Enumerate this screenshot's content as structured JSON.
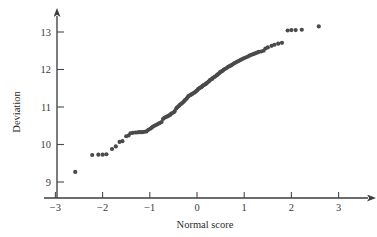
{
  "figure": {
    "kind": "normal-probability-plot",
    "background_color": "#ffffff",
    "point_color": "#4a4a4a",
    "axis_color": "#3d3d3d"
  },
  "chart_data": {
    "type": "scatter",
    "title": "",
    "xlabel": "Normal score",
    "ylabel": "Deviation",
    "xlim": [
      -3.35,
      3.35
    ],
    "ylim": [
      8.6,
      13.45
    ],
    "xticks": [
      -3,
      -2,
      -1,
      0,
      1,
      2,
      3
    ],
    "xtick_labels": [
      "−3",
      "−2",
      "−1",
      "0",
      "1",
      "2",
      "3"
    ],
    "yticks": [
      9,
      10,
      11,
      12,
      13
    ],
    "ytick_labels": [
      "9",
      "10",
      "11",
      "12",
      "13"
    ],
    "grid": false,
    "legend": null,
    "axis_style": "arrow-tipped",
    "marker": "filled-circle",
    "marker_size_px": 2.5,
    "n_points": 117,
    "points": [
      [
        -2.58,
        9.27
      ],
      [
        -2.22,
        9.72
      ],
      [
        -2.09,
        9.73
      ],
      [
        -2.0,
        9.73
      ],
      [
        -1.92,
        9.74
      ],
      [
        -1.8,
        9.88
      ],
      [
        -1.72,
        9.95
      ],
      [
        -1.64,
        10.07
      ],
      [
        -1.58,
        10.09
      ],
      [
        -1.5,
        10.22
      ],
      [
        -1.45,
        10.24
      ],
      [
        -1.41,
        10.3
      ],
      [
        -1.36,
        10.31
      ],
      [
        -1.31,
        10.32
      ],
      [
        -1.27,
        10.32
      ],
      [
        -1.23,
        10.33
      ],
      [
        -1.19,
        10.33
      ],
      [
        -1.15,
        10.33
      ],
      [
        -1.11,
        10.34
      ],
      [
        -1.07,
        10.35
      ],
      [
        -1.03,
        10.39
      ],
      [
        -0.99,
        10.42
      ],
      [
        -0.96,
        10.45
      ],
      [
        -0.93,
        10.48
      ],
      [
        -0.9,
        10.5
      ],
      [
        -0.87,
        10.52
      ],
      [
        -0.84,
        10.54
      ],
      [
        -0.81,
        10.56
      ],
      [
        -0.78,
        10.58
      ],
      [
        -0.75,
        10.6
      ],
      [
        -0.72,
        10.68
      ],
      [
        -0.69,
        10.71
      ],
      [
        -0.66,
        10.73
      ],
      [
        -0.63,
        10.75
      ],
      [
        -0.6,
        10.77
      ],
      [
        -0.57,
        10.79
      ],
      [
        -0.55,
        10.82
      ],
      [
        -0.52,
        10.84
      ],
      [
        -0.49,
        10.86
      ],
      [
        -0.47,
        10.89
      ],
      [
        -0.44,
        10.96
      ],
      [
        -0.42,
        10.99
      ],
      [
        -0.39,
        11.02
      ],
      [
        -0.37,
        11.05
      ],
      [
        -0.34,
        11.08
      ],
      [
        -0.32,
        11.1
      ],
      [
        -0.29,
        11.13
      ],
      [
        -0.27,
        11.16
      ],
      [
        -0.25,
        11.19
      ],
      [
        -0.22,
        11.22
      ],
      [
        -0.2,
        11.26
      ],
      [
        -0.18,
        11.29
      ],
      [
        -0.15,
        11.31
      ],
      [
        -0.13,
        11.33
      ],
      [
        -0.11,
        11.34
      ],
      [
        -0.09,
        11.36
      ],
      [
        -0.06,
        11.38
      ],
      [
        -0.04,
        11.4
      ],
      [
        -0.02,
        11.42
      ],
      [
        0.0,
        11.44
      ],
      [
        0.02,
        11.47
      ],
      [
        0.04,
        11.49
      ],
      [
        0.06,
        11.51
      ],
      [
        0.09,
        11.53
      ],
      [
        0.11,
        11.55
      ],
      [
        0.13,
        11.57
      ],
      [
        0.15,
        11.59
      ],
      [
        0.18,
        11.61
      ],
      [
        0.2,
        11.63
      ],
      [
        0.22,
        11.65
      ],
      [
        0.25,
        11.68
      ],
      [
        0.27,
        11.71
      ],
      [
        0.29,
        11.73
      ],
      [
        0.32,
        11.75
      ],
      [
        0.34,
        11.78
      ],
      [
        0.37,
        11.8
      ],
      [
        0.39,
        11.82
      ],
      [
        0.42,
        11.85
      ],
      [
        0.44,
        11.87
      ],
      [
        0.47,
        11.9
      ],
      [
        0.49,
        11.93
      ],
      [
        0.52,
        11.95
      ],
      [
        0.55,
        11.97
      ],
      [
        0.57,
        12.0
      ],
      [
        0.6,
        12.02
      ],
      [
        0.63,
        12.04
      ],
      [
        0.66,
        12.07
      ],
      [
        0.69,
        12.09
      ],
      [
        0.72,
        12.11
      ],
      [
        0.75,
        12.13
      ],
      [
        0.78,
        12.16
      ],
      [
        0.81,
        12.18
      ],
      [
        0.84,
        12.2
      ],
      [
        0.87,
        12.22
      ],
      [
        0.9,
        12.24
      ],
      [
        0.93,
        12.26
      ],
      [
        0.96,
        12.28
      ],
      [
        0.99,
        12.3
      ],
      [
        1.03,
        12.32
      ],
      [
        1.07,
        12.34
      ],
      [
        1.11,
        12.37
      ],
      [
        1.15,
        12.39
      ],
      [
        1.19,
        12.41
      ],
      [
        1.23,
        12.43
      ],
      [
        1.27,
        12.45
      ],
      [
        1.31,
        12.47
      ],
      [
        1.36,
        12.48
      ],
      [
        1.41,
        12.5
      ],
      [
        1.45,
        12.56
      ],
      [
        1.5,
        12.59
      ],
      [
        1.58,
        12.63
      ],
      [
        1.64,
        12.66
      ],
      [
        1.72,
        12.69
      ],
      [
        1.8,
        12.71
      ],
      [
        1.92,
        13.04
      ],
      [
        2.0,
        13.05
      ],
      [
        2.09,
        13.05
      ],
      [
        2.22,
        13.06
      ],
      [
        2.58,
        13.15
      ]
    ]
  }
}
